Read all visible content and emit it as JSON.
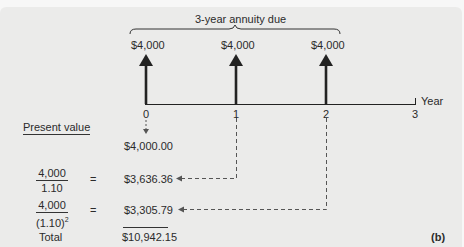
{
  "diagram": {
    "title": "3-year annuity due",
    "panel_label": "(b)",
    "axis_label": "Year",
    "years": [
      "0",
      "1",
      "2",
      "3"
    ],
    "cash_flows": [
      {
        "year": "0",
        "amount": "$4,000"
      },
      {
        "year": "1",
        "amount": "$4,000"
      },
      {
        "year": "2",
        "amount": "$4,000"
      }
    ],
    "present_value": {
      "heading": "Present value",
      "rows": [
        {
          "numerator": "",
          "denominator": "",
          "equals": "",
          "value": "$4,000.00"
        },
        {
          "numerator": "4,000",
          "denominator": "1.10",
          "exponent": "",
          "equals": "=",
          "value": "$3,636.36"
        },
        {
          "numerator": "4,000",
          "denominator": "(1.10)",
          "exponent": "2",
          "equals": "=",
          "value": "$3,305.79"
        }
      ],
      "total_label": "Total",
      "total_value": "$10,942.15"
    },
    "colors": {
      "background": "#ebebea",
      "ink": "#2a2a2a"
    }
  }
}
